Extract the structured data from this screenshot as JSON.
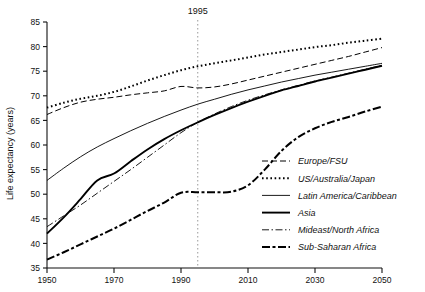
{
  "chart_data": {
    "type": "line",
    "title": "",
    "xlabel": "",
    "ylabel": "Life expectancy (years)",
    "xlim": [
      1950,
      2050
    ],
    "ylim": [
      35,
      85
    ],
    "xticks": [
      1950,
      1970,
      1990,
      2010,
      2030,
      2050
    ],
    "yticks": [
      35,
      40,
      45,
      50,
      55,
      60,
      65,
      70,
      75,
      80,
      85
    ],
    "grid": false,
    "legend_position": "bottom-right",
    "annotations": [
      {
        "label": "1995",
        "type": "vertical-dotted-line",
        "x": 1995
      }
    ],
    "x": [
      1950,
      1955,
      1960,
      1965,
      1970,
      1975,
      1980,
      1985,
      1990,
      1995,
      2000,
      2005,
      2010,
      2015,
      2020,
      2025,
      2030,
      2035,
      2040,
      2045,
      2050
    ],
    "series": [
      {
        "name": "Europe/FSU",
        "style": "dashed",
        "values": [
          66.2,
          67.6,
          68.7,
          69.3,
          69.7,
          70.2,
          70.6,
          71.0,
          71.9,
          71.6,
          71.8,
          72.4,
          73.2,
          74.0,
          74.8,
          75.6,
          76.4,
          77.2,
          78.0,
          78.9,
          79.8
        ]
      },
      {
        "name": "US/Australia/Japan",
        "style": "dotted",
        "values": [
          67.6,
          68.6,
          69.4,
          70.0,
          70.8,
          71.9,
          73.1,
          74.2,
          75.2,
          76.0,
          76.6,
          77.2,
          77.8,
          78.4,
          78.9,
          79.4,
          79.9,
          80.3,
          80.8,
          81.2,
          81.6
        ]
      },
      {
        "name": "Latin America/Caribbean",
        "style": "solid-thin",
        "values": [
          52.8,
          55.3,
          57.6,
          59.6,
          61.3,
          62.9,
          64.4,
          65.8,
          67.1,
          68.3,
          69.3,
          70.3,
          71.2,
          72.0,
          72.8,
          73.5,
          74.2,
          74.8,
          75.4,
          76.0,
          76.6
        ]
      },
      {
        "name": "Asia",
        "style": "solid-thick",
        "values": [
          42.0,
          45.3,
          49.0,
          52.8,
          54.2,
          56.7,
          59.1,
          61.2,
          63.0,
          64.6,
          66.1,
          67.5,
          68.8,
          70.0,
          71.1,
          72.0,
          72.9,
          73.7,
          74.5,
          75.3,
          76.1
        ]
      },
      {
        "name": "Mideast/North Africa",
        "style": "dash-dot",
        "values": [
          43.4,
          45.6,
          47.8,
          50.2,
          52.6,
          55.0,
          57.5,
          60.0,
          62.5,
          64.6,
          66.3,
          67.8,
          69.1,
          70.2,
          71.2,
          72.1,
          73.0,
          73.8,
          74.6,
          75.4,
          76.2
        ]
      },
      {
        "name": "Sub-Saharan Africa",
        "style": "dash-dot-dot-thick",
        "values": [
          36.7,
          38.2,
          39.8,
          41.4,
          43.0,
          44.8,
          46.6,
          48.3,
          50.3,
          50.4,
          50.4,
          50.5,
          51.8,
          55.0,
          58.8,
          61.6,
          63.4,
          64.7,
          65.7,
          66.8,
          67.8
        ]
      }
    ]
  },
  "axes": {
    "y_axis_title": "Life expectancy (years)",
    "y_tick_labels": [
      "85",
      "80",
      "75",
      "70",
      "65",
      "60",
      "55",
      "50",
      "45",
      "40",
      "35"
    ],
    "x_tick_labels": [
      "1950",
      "1970",
      "1990",
      "2010",
      "2030",
      "2050"
    ]
  },
  "annotation": {
    "year_marker_label": "1995"
  },
  "legend": {
    "items": [
      {
        "label": "Europe/FSU",
        "style": "dashed"
      },
      {
        "label": "US/Australia/Japan",
        "style": "dotted"
      },
      {
        "label": "Latin America/Caribbean",
        "style": "solid-thin"
      },
      {
        "label": "Asia",
        "style": "solid-thick"
      },
      {
        "label": "Mideast/North Africa",
        "style": "dash-dot"
      },
      {
        "label": "Sub-Saharan Africa",
        "style": "dash-dot-dot-thick"
      }
    ]
  },
  "colors": {
    "axis": "#111111",
    "series": "#000000",
    "marker_line": "#999999",
    "background": "#ffffff"
  }
}
